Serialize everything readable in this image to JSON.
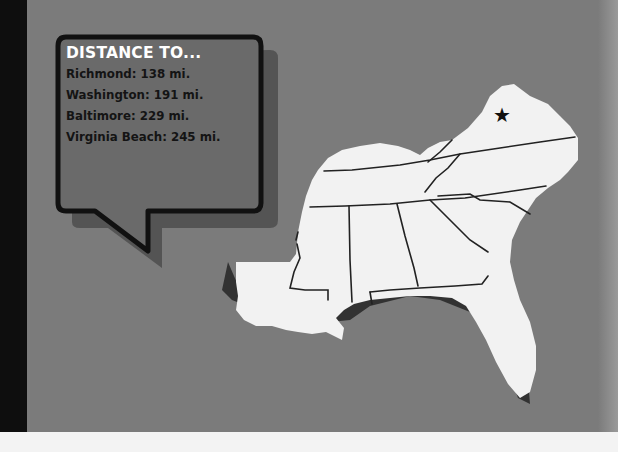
{
  "callout": {
    "title": "DISTANCE TO...",
    "distances": [
      {
        "label": "Richmond: 138 mi."
      },
      {
        "label": "Washington: 191 mi."
      },
      {
        "label": "Baltimore: 229 mi."
      },
      {
        "label": "Virginia Beach: 245 mi."
      }
    ]
  },
  "map": {
    "region": "Southeastern United States",
    "marker": {
      "icon": "star-icon",
      "glyph": "★"
    }
  },
  "colors": {
    "background": "#7b7b7b",
    "bubble_fill": "#6a6a6a",
    "bubble_border": "#111111",
    "land": "#f2f2f2",
    "left_strip": "#0e0e0e"
  }
}
